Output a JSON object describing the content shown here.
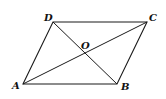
{
  "diagram": {
    "type": "parallelogram-with-diagonals",
    "points": {
      "A": {
        "label": "A",
        "x": 23,
        "y": 84
      },
      "B": {
        "label": "B",
        "x": 117,
        "y": 84
      },
      "C": {
        "label": "C",
        "x": 147,
        "y": 22
      },
      "D": {
        "label": "D",
        "x": 53,
        "y": 22
      },
      "O": {
        "label": "O",
        "x": 85,
        "y": 53
      }
    },
    "segments": [
      "AB",
      "BC",
      "CD",
      "DA",
      "AC",
      "BD"
    ],
    "stroke_color": "#1a1a1a"
  }
}
